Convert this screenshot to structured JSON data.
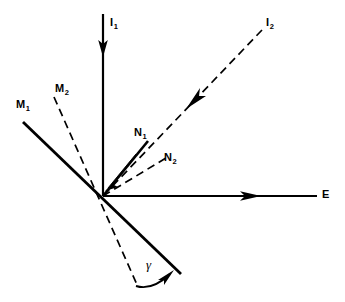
{
  "figure": {
    "type": "vector-diagram",
    "width": 345,
    "height": 302,
    "background_color": "#ffffff",
    "stroke_color": "#000000",
    "origin": {
      "x": 103,
      "y": 196
    }
  },
  "labels": {
    "i1": {
      "text": "I",
      "sub": "1",
      "x": 110,
      "y": 18
    },
    "i2": {
      "text": "I",
      "sub": "2",
      "x": 266,
      "y": 18
    },
    "m1": {
      "text": "M",
      "sub": "1",
      "x": 16,
      "y": 99
    },
    "m2": {
      "text": "M",
      "sub": "2",
      "x": 55,
      "y": 83
    },
    "n1": {
      "text": "N",
      "sub": "1",
      "x": 134,
      "y": 127
    },
    "n2": {
      "text": "N",
      "sub": "2",
      "x": 164,
      "y": 152
    },
    "e": {
      "text": "E",
      "sub": "",
      "x": 322,
      "y": 189
    },
    "gamma": {
      "text": "γ",
      "x": 146,
      "y": 258
    }
  },
  "vectors": [
    {
      "name": "I1",
      "style": "solid",
      "x1": 103,
      "y1": 14,
      "x2": 103,
      "y2": 196,
      "arrow": {
        "x": 103,
        "y": 53,
        "angle_deg": 90
      },
      "width": 2.2
    },
    {
      "name": "I2",
      "style": "dashed",
      "x1": 262,
      "y1": 30,
      "x2": 103,
      "y2": 196,
      "arrow": {
        "x": 195,
        "y": 100,
        "angle_deg": 133.8
      },
      "width": 1.6
    },
    {
      "name": "M1",
      "style": "solid",
      "x1": 23,
      "y1": 122,
      "x2": 181,
      "y2": 274,
      "width": 2.6
    },
    {
      "name": "M2",
      "style": "dashed",
      "x1": 54,
      "y1": 97,
      "x2": 138,
      "y2": 287,
      "width": 1.6
    },
    {
      "name": "N1",
      "style": "solid",
      "x1": 103,
      "y1": 196,
      "x2": 148,
      "y2": 141,
      "arrow": {
        "x": 112,
        "y": 185,
        "angle_deg": 230.7
      },
      "width": 2.4
    },
    {
      "name": "N2",
      "style": "dashed",
      "x1": 103,
      "y1": 196,
      "x2": 166,
      "y2": 158,
      "width": 1.6
    },
    {
      "name": "E",
      "style": "solid",
      "x1": 103,
      "y1": 196,
      "x2": 317,
      "y2": 196,
      "arrow": {
        "x": 256,
        "y": 196,
        "angle_deg": 0
      },
      "width": 2.2
    }
  ],
  "angle_arc": {
    "name": "gamma-arc",
    "from": {
      "x": 136,
      "y": 287
    },
    "to": {
      "x": 173,
      "y": 272
    },
    "arrow_angle_deg": -22
  }
}
